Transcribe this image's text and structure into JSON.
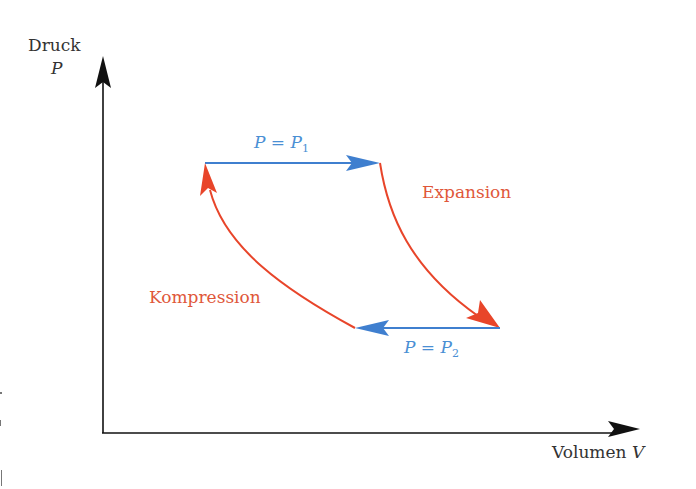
{
  "diagram": {
    "type": "pv-diagram",
    "colors": {
      "axis": "#111111",
      "isobar": "#3f7fcf",
      "adiabat": "#e8452a",
      "isobar_label": "#4a8fd4",
      "process_label": "#e0573a"
    },
    "y_axis": {
      "label": "Druck",
      "symbol": "P"
    },
    "x_axis": {
      "label": "Volumen",
      "symbol": "V"
    },
    "processes": {
      "top": {
        "label_lhs": "P",
        "label_eq": "=",
        "label_rhs": "P",
        "label_sub": "1",
        "direction": "right"
      },
      "bottom": {
        "label_lhs": "P",
        "label_eq": "=",
        "label_rhs": "P",
        "label_sub": "2",
        "direction": "left"
      },
      "right": {
        "label": "Expansion",
        "direction": "down"
      },
      "left": {
        "label": "Kompression",
        "direction": "up"
      }
    }
  }
}
